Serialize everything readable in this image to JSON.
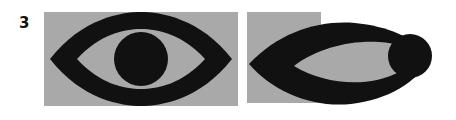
{
  "figure": {
    "label": "3",
    "caption": "",
    "background_color": "#ffffff",
    "panel_fill_color": "#a9a9a9",
    "shape_fill_color": "#111111"
  },
  "panels": [
    {
      "id": "panel-a",
      "name": "undistorted-eye-panel",
      "position": "left",
      "background_color": "#a9a9a9",
      "x": 44,
      "y": 12,
      "width": 194,
      "height": 94,
      "shape": {
        "name": "eye-symbol",
        "description": "symmetric almond eye outline with circular pupil",
        "parts": [
          {
            "name": "eye-outline",
            "type": "lens",
            "fill": "#111111"
          },
          {
            "name": "sclera",
            "type": "lens-cutout",
            "fill": "#a9a9a9"
          },
          {
            "name": "pupil",
            "type": "circle",
            "fill": "#111111",
            "cx": 97,
            "cy": 47,
            "r": 27
          }
        ]
      }
    },
    {
      "id": "panel-b",
      "name": "distorted-eye-panel",
      "position": "right",
      "background_color": "#a9a9a9",
      "x": 247,
      "y": 12,
      "width": 74,
      "height": 91,
      "shape": {
        "name": "eye-symbol-distorted",
        "description": "horizontally sheared eye with pupil displaced to the right edge",
        "parts": [
          {
            "name": "eye-outline",
            "type": "lens",
            "fill": "#111111"
          },
          {
            "name": "sclera",
            "type": "lens-cutout",
            "fill": "#a9a9a9"
          },
          {
            "name": "pupil",
            "type": "circle",
            "fill": "#111111",
            "cx": 163,
            "cy": 44,
            "r": 22
          }
        ]
      }
    }
  ]
}
